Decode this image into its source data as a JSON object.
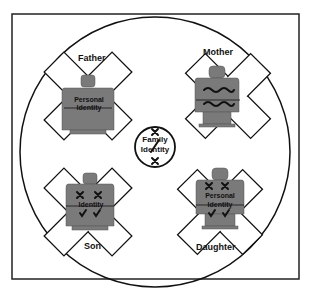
{
  "diagram": {
    "center": {
      "line1": "Family",
      "line2": "Identity",
      "marks": [
        "cross",
        "slash",
        "cross"
      ]
    },
    "figures": [
      {
        "id": "father",
        "label": "Father",
        "text1": "Personal",
        "text2": "Identity",
        "marks": "none"
      },
      {
        "id": "mother",
        "label": "Mother",
        "text1": "Personal",
        "text2": "Identity",
        "marks": "scribbled"
      },
      {
        "id": "son",
        "label": "Son",
        "text1": "Personal",
        "text2": "Identity",
        "marks": "crosses-over-text-and-checks"
      },
      {
        "id": "daughter",
        "label": "Daughter",
        "text1": "Personal",
        "text2": "Identity",
        "marks": "crosses-and-checks"
      }
    ],
    "colors": {
      "figure_fill": "#7a7a7a",
      "stroke": "#111111",
      "background": "#ffffff"
    }
  }
}
